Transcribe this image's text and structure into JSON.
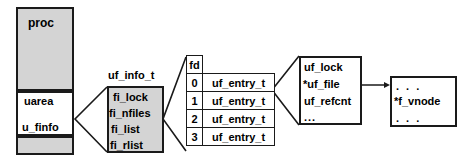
{
  "diagram": {
    "colors": {
      "stroke": "#1a1a1a",
      "fill_gray": "#d4d4d4",
      "fill_white": "#ffffff"
    }
  },
  "proc": {
    "title": "proc",
    "uarea_label": "uarea",
    "u_finfo_label": "u_finfo"
  },
  "uf_info": {
    "type_label": "uf_info_t",
    "fields": [
      "fi_lock",
      "fi_nfiles",
      "fi_list",
      "fi_rlist"
    ]
  },
  "fd_table": {
    "header": "fd",
    "rows": [
      {
        "fd": "0",
        "entry": "uf_entry_t"
      },
      {
        "fd": "1",
        "entry": "uf_entry_t"
      },
      {
        "fd": "2",
        "entry": "uf_entry_t"
      },
      {
        "fd": "3",
        "entry": "uf_entry_t"
      }
    ]
  },
  "uf_entry": {
    "fields": [
      "uf_lock",
      "*uf_file",
      "uf_refcnt",
      "..."
    ]
  },
  "file": {
    "fields": [
      ". . .",
      "*f_vnode",
      ". . ."
    ]
  }
}
